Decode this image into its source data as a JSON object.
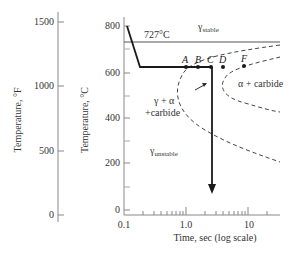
{
  "diagram": {
    "type": "TTT diagram (isothermal transformation)",
    "left_axis": {
      "title": "Temperature, °F",
      "ticks": [
        "1500",
        "1000",
        "500",
        "0"
      ]
    },
    "right_axis": {
      "title": "Temperature, °C",
      "ticks": [
        "800",
        "600",
        "400",
        "200",
        "0"
      ]
    },
    "x_axis": {
      "title": "Time, sec (log scale)",
      "ticks": [
        "0.1",
        "1.0",
        "10"
      ]
    },
    "eutectoid_label": "727°C",
    "regions": {
      "gamma_stable": {
        "symbol": "γ",
        "subscript": "stable"
      },
      "gamma_unstable": {
        "symbol": "γ",
        "subscript": "unstable"
      },
      "mixed_line1": "γ + α",
      "mixed_line2": "+carbide",
      "alpha_carbide": "α + carbide"
    },
    "points": [
      "A",
      "B",
      "C",
      "D",
      "F"
    ],
    "colors": {
      "line": "#1a1a1a",
      "axis": "#888888",
      "dashed": "#444444"
    }
  }
}
